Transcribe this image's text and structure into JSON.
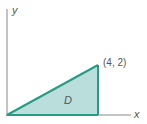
{
  "diagram": {
    "axes": {
      "x_label": "x",
      "y_label": "y"
    },
    "region_label": "D",
    "vertex_label": "(4, 2)",
    "vertices": [
      [
        0,
        0
      ],
      [
        4,
        0
      ],
      [
        4,
        2
      ]
    ],
    "colors": {
      "fill": "#b9dedb",
      "edge": "#2a9a82",
      "axis": "#888888"
    }
  }
}
